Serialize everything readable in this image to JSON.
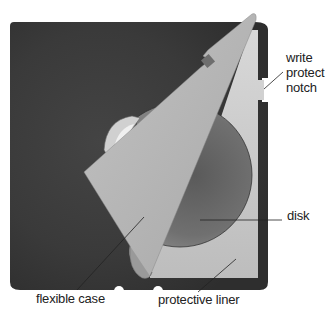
{
  "diagram": {
    "labels": {
      "write_protect_notch": [
        "write",
        "protect",
        "notch"
      ],
      "disk": "disk",
      "flexible_case": "flexible case",
      "protective_liner": "protective liner"
    },
    "colors": {
      "case_dark": "#3a3a3a",
      "case_flap": "#b4b4b4",
      "liner": "#c9c9c9",
      "disk": "#6a6a6a",
      "leader_line": "#222222",
      "background": "#ffffff"
    }
  }
}
